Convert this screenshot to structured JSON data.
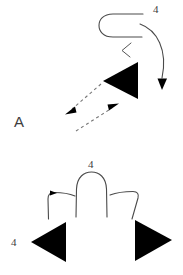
{
  "figure": {
    "title": "",
    "background_color": "#ffffff",
    "line_color": "#4a4a4a",
    "fill_color": "#000000",
    "dashed_color": "#777777",
    "width": 183,
    "height": 275
  },
  "labels": {
    "top_right_number": "4",
    "left_letter": "A",
    "bottom_center_number": "4",
    "bottom_left_number": "4"
  },
  "elements": {
    "upper_group": {
      "u_turn_path": "u-turn-hook",
      "chevron": "<",
      "big_triangle": "left-pointing-triangle",
      "sweep_arrow": "curved-arrow-down-right",
      "dashed_arrow_upper": "dashed-arrow-down-left",
      "dashed_arrow_lower": "dashed-arrow-up-right"
    },
    "lower_group": {
      "arch": "inverted-u-arch",
      "left_hook": "left-hook-bracket",
      "right_hook": "right-hook-bracket",
      "left_triangle": "left-pointing-triangle",
      "right_triangle": "right-pointing-triangle"
    }
  }
}
